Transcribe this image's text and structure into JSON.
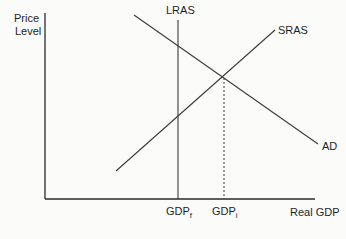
{
  "diagram": {
    "y_axis_label_line1": "Price",
    "y_axis_label_line2": "Level",
    "x_axis_label": "Real GDP",
    "curves": {
      "lras": "LRAS",
      "sras": "SRAS",
      "ad": "AD"
    },
    "x_ticks": {
      "gdp_f_base": "GDP",
      "gdp_f_sub": "f",
      "gdp_i_base": "GDP",
      "gdp_i_sub": "i"
    },
    "colors": {
      "line": "#3a3a3a",
      "axis": "#2a2a2a",
      "background": "#fbfbfa"
    }
  }
}
